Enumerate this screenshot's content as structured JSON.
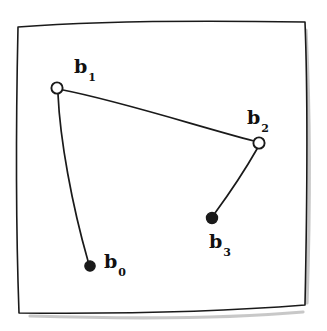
{
  "figure": {
    "background_color": "#ffffff",
    "ink_color": "#1a1a1a",
    "shadow_color": "#9a9a9a",
    "frame": {
      "name": "hand-drawn-square-border",
      "path": "M 18,27 C 80,22 180,20 305,22 C 308,100 307,210 305,305 C 230,311 120,314 19,313 C 16,230 16,120 18,27 Z",
      "stroke_width": 1.6
    },
    "shadow": {
      "right_path": "M 306,30 C 310,110 310,215 307,303",
      "bottom_path": "M 30,316 C 130,319 235,318 303,312",
      "stroke_width": 3.2
    },
    "points": [
      {
        "id": "b0",
        "label": "b",
        "subscript": "0",
        "marker": "filled-circle",
        "cx": 90,
        "cy": 266,
        "r": 5.2,
        "label_x": 104,
        "label_y": 252
      },
      {
        "id": "b1",
        "label": "b",
        "subscript": "1",
        "marker": "open-circle",
        "cx": 57,
        "cy": 88,
        "r": 5.6,
        "label_x": 74,
        "label_y": 57
      },
      {
        "id": "b2",
        "label": "b",
        "subscript": "2",
        "marker": "open-circle",
        "cx": 259,
        "cy": 143,
        "r": 5.6,
        "label_x": 247,
        "label_y": 108
      },
      {
        "id": "b3",
        "label": "b",
        "subscript": "3",
        "marker": "filled-circle",
        "cx": 212,
        "cy": 218,
        "r": 5.6,
        "label_x": 209,
        "label_y": 232
      }
    ],
    "segments": [
      {
        "id": "seg-b1-b2",
        "from": "b1",
        "to": "b2",
        "path": "M 63,90 C 120,101 200,127 254,141",
        "stroke_width": 1.7
      },
      {
        "id": "seg-b1-b0",
        "from": "b1",
        "to": "b0",
        "path": "M 58,94 C 60,140 72,205 88,261",
        "stroke_width": 1.7
      },
      {
        "id": "seg-b2-b3",
        "from": "b2",
        "to": "b3",
        "path": "M 257,149 C 245,170 226,198 215,213",
        "stroke_width": 1.7
      }
    ]
  }
}
